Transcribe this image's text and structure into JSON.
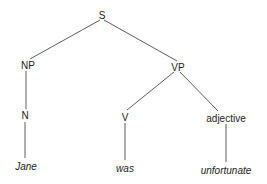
{
  "diagram": {
    "type": "syntax-tree",
    "nodes": [
      {
        "id": "S",
        "label": "S",
        "x": 102,
        "y": 15
      },
      {
        "id": "NP",
        "label": "NP",
        "x": 28,
        "y": 65
      },
      {
        "id": "VP",
        "label": "VP",
        "x": 178,
        "y": 67
      },
      {
        "id": "N",
        "label": "N",
        "x": 25,
        "y": 115
      },
      {
        "id": "V",
        "label": "V",
        "x": 125,
        "y": 117
      },
      {
        "id": "ADJ",
        "label": "adjective",
        "x": 226,
        "y": 118
      },
      {
        "id": "Jane",
        "label": "Jane",
        "x": 26,
        "y": 166,
        "leaf": true
      },
      {
        "id": "was",
        "label": "was",
        "x": 125,
        "y": 168,
        "leaf": true
      },
      {
        "id": "unfortunate",
        "label": "unfortunate",
        "x": 226,
        "y": 170,
        "leaf": true
      }
    ],
    "edges": [
      [
        "S",
        "NP"
      ],
      [
        "S",
        "VP"
      ],
      [
        "NP",
        "N"
      ],
      [
        "VP",
        "V"
      ],
      [
        "VP",
        "ADJ"
      ],
      [
        "N",
        "Jane"
      ],
      [
        "V",
        "was"
      ],
      [
        "ADJ",
        "unfortunate"
      ]
    ],
    "line_color": "#333333"
  }
}
